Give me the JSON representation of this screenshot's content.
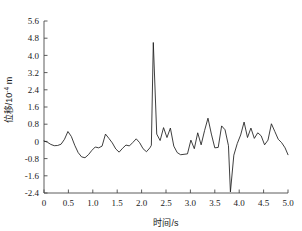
{
  "chart_data": {
    "type": "line",
    "title": "",
    "xlabel": "时间/s",
    "ylabel": "位移/10⁻⁴ m",
    "ylabel_parts": {
      "prefix": "位移/10",
      "exponent": "-4",
      "suffix": " m"
    },
    "xlim": [
      0,
      5.0
    ],
    "ylim": [
      -2.4,
      5.6
    ],
    "grid": false,
    "legend": null,
    "legend_position": "none",
    "line_color": "#1c1c1c",
    "axis_color": "#4a4a4a",
    "background_color": "#ffffff",
    "xticks": [
      0,
      0.5,
      1.0,
      1.5,
      2.0,
      2.5,
      3.0,
      3.5,
      4.0,
      4.5,
      5.0
    ],
    "xtick_labels": [
      "0",
      "0.5",
      "1.0",
      "1.5",
      "2.0",
      "2.5",
      "3.0",
      "3.5",
      "4.0",
      "4.5",
      "5.0"
    ],
    "yticks": [
      -2.4,
      -1.6,
      -0.8,
      0,
      0.8,
      1.6,
      2.4,
      3.2,
      4.0,
      4.8,
      5.6
    ],
    "ytick_labels": [
      "-2.4",
      "-1.6",
      "-0.8",
      "0",
      "0.8",
      "1.6",
      "2.4",
      "3.2",
      "4.0",
      "4.8",
      "5.6"
    ],
    "annotations": [
      {
        "label": "main positive peak",
        "x": 2.2,
        "y": 4.6
      },
      {
        "label": "deep negative spike",
        "x": 3.8,
        "y": -2.35
      }
    ],
    "x": [
      0.0,
      0.07,
      0.14,
      0.21,
      0.28,
      0.35,
      0.42,
      0.49,
      0.56,
      0.63,
      0.7,
      0.77,
      0.84,
      0.91,
      0.98,
      1.05,
      1.12,
      1.19,
      1.26,
      1.33,
      1.4,
      1.47,
      1.54,
      1.61,
      1.68,
      1.75,
      1.82,
      1.89,
      1.96,
      2.03,
      2.1,
      2.17,
      2.2,
      2.24,
      2.31,
      2.38,
      2.45,
      2.52,
      2.59,
      2.66,
      2.73,
      2.8,
      2.87,
      2.94,
      3.01,
      3.08,
      3.15,
      3.22,
      3.29,
      3.36,
      3.43,
      3.5,
      3.57,
      3.64,
      3.71,
      3.78,
      3.82,
      3.89,
      3.96,
      4.03,
      4.1,
      4.17,
      4.24,
      4.31,
      4.38,
      4.45,
      4.52,
      4.59,
      4.66,
      4.73,
      4.8,
      4.87,
      4.94,
      5.0
    ],
    "y": [
      0.02,
      -0.04,
      -0.14,
      -0.2,
      -0.19,
      -0.13,
      0.1,
      0.46,
      0.23,
      -0.18,
      -0.52,
      -0.72,
      -0.76,
      -0.62,
      -0.42,
      -0.26,
      -0.3,
      -0.22,
      0.34,
      0.14,
      -0.07,
      -0.35,
      -0.5,
      -0.32,
      -0.17,
      -0.21,
      -0.05,
      0.12,
      -0.06,
      -0.34,
      -0.48,
      -0.3,
      -0.18,
      4.6,
      0.34,
      0.04,
      0.64,
      0.18,
      0.62,
      -0.22,
      -0.52,
      -0.62,
      -0.6,
      -0.58,
      0.06,
      -0.34,
      0.4,
      -0.16,
      0.5,
      1.08,
      0.34,
      -0.3,
      -0.28,
      0.72,
      0.54,
      -0.2,
      -2.35,
      -0.64,
      -0.1,
      0.3,
      0.9,
      0.18,
      0.62,
      0.14,
      0.4,
      0.26,
      -0.16,
      0.06,
      0.82,
      0.46,
      0.1,
      -0.06,
      -0.3,
      -0.62
    ]
  }
}
